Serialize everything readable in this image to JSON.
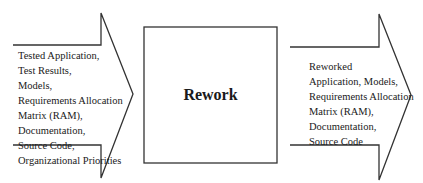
{
  "diagram": {
    "type": "process-flow",
    "colors": {
      "stroke": "#333333",
      "text": "#1a1a1a",
      "background": "#ffffff"
    },
    "input_arrow": {
      "lines": [
        "Tested Application,",
        "Test Results,",
        "Models,",
        "Requirements Allocation",
        "Matrix (RAM),",
        "Documentation,",
        "Source Code,",
        "Organizational Priorities"
      ]
    },
    "process": {
      "title": "Rework"
    },
    "output_arrow": {
      "lines": [
        "Reworked",
        "Application, Models,",
        "Requirements Allocation",
        "Matrix (RAM),",
        "Documentation,",
        "Source Code"
      ]
    }
  }
}
